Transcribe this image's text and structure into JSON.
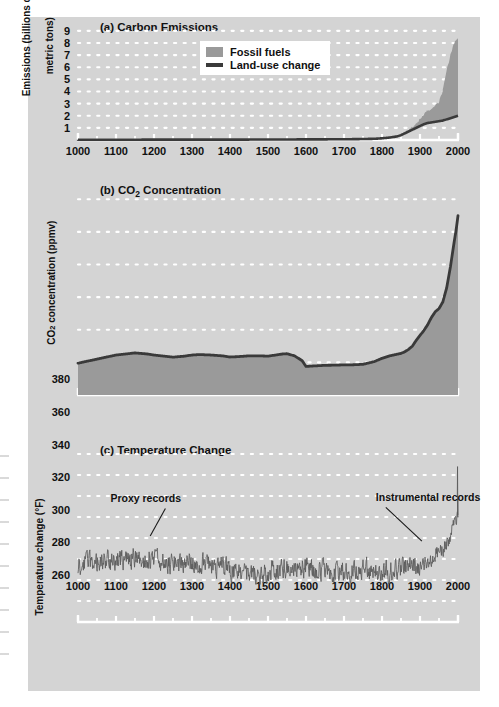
{
  "figure": {
    "background_color": "#d4d4d4",
    "page_color": "#ffffff",
    "grid_dot_color": "#ffffff",
    "axis_color": "#ffffff",
    "series_line_color": "#3a3a3a",
    "fill_light": "#c0c0c0",
    "fill_dark": "#9a9a9a"
  },
  "chart_data": [
    {
      "type": "area",
      "panel": "a",
      "title": "(a) Carbon Emissions",
      "xlabel": "",
      "ylabel": "Emissions (billions of\nmetric tons)",
      "ylabel_line1": "Emissions (billions of",
      "ylabel_line2": "metric tons)",
      "xlim": [
        1000,
        2000
      ],
      "ylim": [
        0,
        9.4
      ],
      "xticks": [
        1000,
        1100,
        1200,
        1300,
        1400,
        1500,
        1600,
        1700,
        1800,
        1900,
        2000
      ],
      "yticks": [
        1,
        2,
        3,
        4,
        5,
        6,
        7,
        8,
        9
      ],
      "grid": "dotted",
      "legend_position": "upper-center",
      "legend": [
        {
          "label": "Fossil fuels",
          "marker": "filled-square",
          "color": "#9a9a9a"
        },
        {
          "label": "Land-use change",
          "marker": "line",
          "color": "#3a3a3a"
        }
      ],
      "series": [
        {
          "name": "Land-use change",
          "x": [
            1000,
            1100,
            1200,
            1300,
            1400,
            1500,
            1600,
            1700,
            1750,
            1780,
            1800,
            1820,
            1840,
            1850,
            1860,
            1870,
            1880,
            1890,
            1900,
            1910,
            1920,
            1930,
            1940,
            1950,
            1960,
            1970,
            1980,
            1990,
            1995,
            2000
          ],
          "values": [
            0.02,
            0.02,
            0.03,
            0.03,
            0.03,
            0.04,
            0.05,
            0.06,
            0.08,
            0.1,
            0.14,
            0.2,
            0.3,
            0.4,
            0.55,
            0.7,
            0.85,
            1.0,
            1.15,
            1.3,
            1.4,
            1.45,
            1.5,
            1.55,
            1.6,
            1.7,
            1.8,
            1.9,
            1.95,
            2.0
          ]
        },
        {
          "name": "Fossil fuels",
          "x": [
            1000,
            1750,
            1800,
            1850,
            1870,
            1890,
            1900,
            1910,
            1920,
            1930,
            1940,
            1950,
            1960,
            1970,
            1980,
            1990,
            1995,
            2000
          ],
          "values": [
            0.0,
            0.0,
            0.01,
            0.05,
            0.15,
            0.35,
            0.55,
            0.85,
            1.0,
            1.1,
            1.3,
            1.6,
            2.5,
            4.0,
            5.2,
            6.1,
            6.4,
            6.3
          ]
        }
      ]
    },
    {
      "type": "area",
      "panel": "b",
      "title": "(b) CO2 Concentration",
      "title_pre": "(b) CO",
      "title_sub": "2",
      "title_post": " Concentration",
      "xlabel": "",
      "ylabel": "CO2 concentration (ppmv)",
      "ylabel_pre": "CO",
      "ylabel_sub": "2",
      "ylabel_post": " concentration (ppmv)",
      "xlim": [
        1000,
        2000
      ],
      "ylim": [
        260,
        382
      ],
      "xticks": [
        1000,
        1100,
        1200,
        1300,
        1400,
        1500,
        1600,
        1700,
        1800,
        1900,
        2000
      ],
      "yticks": [
        260,
        280,
        300,
        320,
        340,
        360,
        380
      ],
      "grid": "dotted",
      "series": [
        {
          "name": "CO2 concentration",
          "x": [
            1000,
            1020,
            1050,
            1080,
            1100,
            1120,
            1150,
            1180,
            1200,
            1220,
            1250,
            1280,
            1300,
            1320,
            1350,
            1380,
            1400,
            1420,
            1450,
            1480,
            1500,
            1520,
            1540,
            1550,
            1570,
            1590,
            1600,
            1620,
            1650,
            1680,
            1700,
            1720,
            1750,
            1780,
            1800,
            1820,
            1840,
            1850,
            1860,
            1870,
            1880,
            1890,
            1900,
            1910,
            1920,
            1930,
            1940,
            1950,
            1960,
            1970,
            1980,
            1990,
            1995,
            2000
          ],
          "values": [
            279.5,
            280.5,
            282.0,
            283.5,
            284.5,
            285.0,
            285.8,
            285.2,
            284.5,
            284.0,
            283.2,
            283.8,
            284.5,
            284.8,
            284.5,
            284.0,
            283.3,
            283.5,
            284.0,
            284.0,
            283.8,
            284.5,
            285.2,
            285.3,
            284.0,
            281.0,
            277.5,
            277.8,
            278.2,
            278.3,
            278.5,
            278.5,
            278.8,
            280.5,
            282.5,
            284.0,
            285.0,
            285.5,
            286.5,
            288.0,
            290.0,
            293.5,
            296.5,
            299.5,
            303.0,
            307.5,
            311.0,
            313.0,
            317.0,
            325.5,
            338.5,
            354.0,
            361.0,
            370.0
          ]
        }
      ]
    },
    {
      "type": "line",
      "panel": "c",
      "title": "(c) Temperature Change",
      "xlabel": "",
      "ylabel": "Temperature change (°F)",
      "xlim": [
        1000,
        2000
      ],
      "ylim": [
        -0.6,
        1.0
      ],
      "xticks": [
        1000,
        1100,
        1200,
        1300,
        1400,
        1500,
        1600,
        1700,
        1800,
        1900,
        2000
      ],
      "yticks": [
        1,
        0.8,
        0.6,
        0.4,
        0.2,
        0,
        -0.2,
        -0.4,
        -0.6
      ],
      "ytick_labels": [
        "1",
        "0.8",
        "0.6",
        "0.4",
        "0.2",
        "0",
        "–0.2",
        "–0.4",
        "–0.6"
      ],
      "grid": "dotted",
      "annotations": [
        {
          "text": "Proxy records",
          "x": 1230,
          "y": 0.52,
          "leader_to_x": 1190,
          "leader_to_y": 0.22
        },
        {
          "text": "Instrumental records",
          "x": 1810,
          "y": 0.53,
          "leader_to_x": 1905,
          "leader_to_y": 0.17
        }
      ],
      "series": [
        {
          "name": "Temperature anomaly (proxy + instrumental)",
          "note": "Annual reconstructed anomaly, 1000-2000 AD, noisy series oscillating about -0.05 °F until ~1900, then rising to +0.9 °F",
          "baseline_pre1900": -0.05,
          "peak": 0.88,
          "min": -0.43
        }
      ]
    }
  ]
}
